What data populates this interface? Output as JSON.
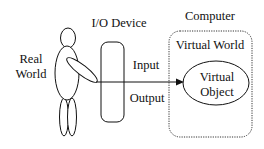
{
  "diagram": {
    "labels": {
      "real_world_line1": "Real",
      "real_world_line2": "World",
      "io_device": "I/O Device",
      "computer": "Computer",
      "virtual_world": "Virtual World",
      "input": "Input",
      "output": "Output",
      "virtual_object_line1": "Virtual",
      "virtual_object_line2": "Object"
    },
    "nodes": [
      {
        "id": "human",
        "label": "Real World",
        "shape": "stick-figure"
      },
      {
        "id": "io-device",
        "label": "I/O Device",
        "shape": "rounded-rect"
      },
      {
        "id": "computer",
        "label": "Computer",
        "shape": "dotted-rounded-rect",
        "contains": [
          "virtual-world"
        ]
      },
      {
        "id": "virtual-world",
        "label": "Virtual World",
        "shape": "region"
      },
      {
        "id": "virtual-object",
        "label": "Virtual Object",
        "shape": "ellipse"
      }
    ],
    "edges": [
      {
        "from": "human",
        "to": "virtual-object",
        "via": "io-device",
        "labels": [
          "Input",
          "Output"
        ],
        "arrow": "end"
      }
    ],
    "colors": {
      "stroke": "#111111",
      "background": "#ffffff"
    }
  }
}
